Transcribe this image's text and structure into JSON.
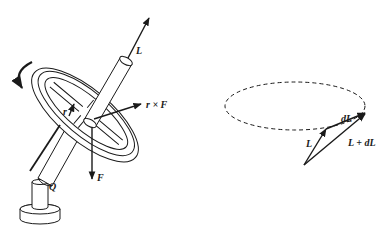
{
  "figure": {
    "left_panel": {
      "description": "Spinning wheel (gyroscope) on a tilted axle supported at pivot Q on a post",
      "labels": {
        "angular_momentum": "L",
        "radius_vector": "r",
        "torque": "r × F",
        "force": "F",
        "pivot": "Q"
      }
    },
    "right_panel": {
      "description": "Vector diagram: L precesses around a dashed circular path; L + dL = new angular momentum",
      "labels": {
        "L": "L",
        "dL": "dL",
        "L_plus_dL": "L + dL"
      }
    },
    "colors": {
      "stroke": "#1a1a1a",
      "background": "#ffffff"
    }
  }
}
